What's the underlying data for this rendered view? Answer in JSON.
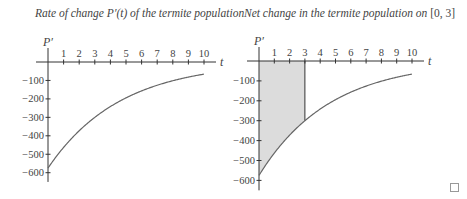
{
  "chart_data": [
    {
      "type": "line",
      "title": "Rate of change P′(t) of the termite population",
      "xlabel": "t",
      "ylabel": "P′",
      "x_ticks": [
        "1",
        "2",
        "3",
        "4",
        "5",
        "6",
        "7",
        "8",
        "9",
        "10"
      ],
      "y_ticks": [
        "−100",
        "−200",
        "−300",
        "−400",
        "−500",
        "−600"
      ],
      "xlim": [
        0,
        10
      ],
      "ylim": [
        -650,
        0
      ],
      "grid": false,
      "series": [
        {
          "name": "P′(t)",
          "x": [
            0,
            1,
            2,
            3,
            4,
            5,
            6,
            7,
            8,
            9,
            10
          ],
          "values": [
            -575,
            -463,
            -373,
            -300,
            -242,
            -194,
            -157,
            -126,
            -101,
            -82,
            -66
          ]
        }
      ]
    },
    {
      "type": "area",
      "title": "Net change in the termite population on [0, 3]",
      "xlabel": "t",
      "ylabel": "P′",
      "x_ticks": [
        "1",
        "2",
        "3",
        "4",
        "5",
        "6",
        "7",
        "8",
        "9",
        "10"
      ],
      "y_ticks": [
        "−100",
        "−200",
        "−300",
        "−400",
        "−500",
        "−600"
      ],
      "xlim": [
        0,
        10
      ],
      "ylim": [
        -650,
        0
      ],
      "grid": false,
      "shaded_interval": [
        0,
        3
      ],
      "series": [
        {
          "name": "P′(t)",
          "x": [
            0,
            1,
            2,
            3,
            4,
            5,
            6,
            7,
            8,
            9,
            10
          ],
          "values": [
            -575,
            -463,
            -373,
            -300,
            -242,
            -194,
            -157,
            -126,
            -101,
            -82,
            -66
          ]
        }
      ]
    }
  ],
  "left": {
    "title": "Rate of change P′(t) of the termite population",
    "y_axis_label": "P′",
    "x_axis_label": "t"
  },
  "right": {
    "title_prefix": "Net change in the termite population on ",
    "title_interval": "[0, 3]",
    "y_axis_label": "P′",
    "x_axis_label": "t"
  },
  "colors": {
    "curve": "#666666",
    "axis": "#333333",
    "shade": "#dcdcdc"
  }
}
